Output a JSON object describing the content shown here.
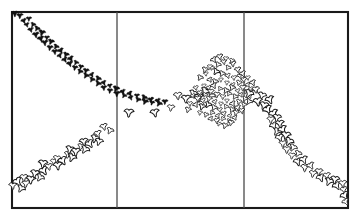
{
  "figure": {
    "title": "",
    "background_color": "#ffffff",
    "ink_color": "#111111",
    "frame_color": "#1a1a1a",
    "divider_color": "#4a4a4a",
    "width": 359,
    "height": 221
  },
  "frame": {
    "name": "plot-frame",
    "x": 12,
    "y": 12,
    "width": 336,
    "height": 196,
    "stroke_width": 2.1
  },
  "panels": {
    "count": 3,
    "divider_x": [
      117,
      244
    ],
    "labels": [
      "",
      "",
      ""
    ]
  },
  "axes": {
    "xlabel": "",
    "ylabel": "",
    "xticks": [],
    "yticks": [],
    "grid": false
  },
  "legend": {
    "visible": false,
    "entries": []
  },
  "chart_data": {
    "type": "scatter",
    "title": "",
    "xlabel": "",
    "ylabel": "",
    "xlim": [
      12,
      348
    ],
    "ylim": [
      208,
      12
    ],
    "grid": false,
    "legend_position": "none",
    "marker_style": "bird-glyph",
    "panel_dividers_x": [
      117,
      244
    ],
    "series": [
      {
        "name": "descending-dark-trail",
        "marker": "bird-glyph-filled",
        "color": "#111111",
        "points": [
          [
            15,
            14
          ],
          [
            20,
            16
          ],
          [
            24,
            21
          ],
          [
            29,
            19
          ],
          [
            27,
            25
          ],
          [
            33,
            25
          ],
          [
            31,
            30
          ],
          [
            37,
            29
          ],
          [
            36,
            35
          ],
          [
            42,
            33
          ],
          [
            41,
            39
          ],
          [
            47,
            38
          ],
          [
            45,
            43
          ],
          [
            51,
            42
          ],
          [
            50,
            48
          ],
          [
            56,
            47
          ],
          [
            55,
            52
          ],
          [
            61,
            51
          ],
          [
            60,
            56
          ],
          [
            66,
            55
          ],
          [
            65,
            60
          ],
          [
            71,
            59
          ],
          [
            70,
            64
          ],
          [
            76,
            63
          ],
          [
            75,
            68
          ],
          [
            81,
            67
          ],
          [
            80,
            72
          ],
          [
            86,
            71
          ],
          [
            86,
            76
          ],
          [
            92,
            75
          ],
          [
            92,
            80
          ],
          [
            98,
            79
          ],
          [
            98,
            84
          ],
          [
            104,
            83
          ],
          [
            104,
            88
          ],
          [
            110,
            86
          ],
          [
            110,
            91
          ],
          [
            116,
            89
          ],
          [
            117,
            94
          ],
          [
            123,
            92
          ],
          [
            124,
            96
          ],
          [
            130,
            94
          ],
          [
            131,
            98
          ],
          [
            137,
            96
          ],
          [
            138,
            100
          ],
          [
            144,
            98
          ],
          [
            145,
            102
          ],
          [
            151,
            100
          ],
          [
            152,
            103
          ],
          [
            158,
            101
          ],
          [
            159,
            104
          ],
          [
            165,
            102
          ]
        ]
      },
      {
        "name": "valley-and-rise",
        "marker": "bird-glyph-open",
        "color": "#1b1b1b",
        "points": [
          [
            129,
            113
          ],
          [
            155,
            113
          ],
          [
            171,
            108
          ],
          [
            178,
            96
          ],
          [
            186,
            99
          ],
          [
            193,
            94
          ],
          [
            199,
            98
          ],
          [
            205,
            92
          ],
          [
            211,
            96
          ]
        ]
      },
      {
        "name": "ascending-open-trail",
        "marker": "bird-glyph-open",
        "color": "#1b1b1b",
        "points": [
          [
            13,
            186
          ],
          [
            18,
            182
          ],
          [
            21,
            189
          ],
          [
            26,
            184
          ],
          [
            24,
            178
          ],
          [
            31,
            180
          ],
          [
            35,
            174
          ],
          [
            40,
            178
          ],
          [
            44,
            171
          ],
          [
            43,
            164
          ],
          [
            49,
            167
          ],
          [
            54,
            162
          ],
          [
            58,
            166
          ],
          [
            57,
            159
          ],
          [
            63,
            161
          ],
          [
            68,
            155
          ],
          [
            72,
            158
          ],
          [
            70,
            150
          ],
          [
            76,
            152
          ],
          [
            81,
            147
          ],
          [
            85,
            150
          ],
          [
            84,
            142
          ],
          [
            90,
            144
          ],
          [
            95,
            139
          ],
          [
            99,
            142
          ],
          [
            98,
            134
          ],
          [
            104,
            127
          ],
          [
            110,
            131
          ]
        ]
      },
      {
        "name": "cluster-scatter",
        "marker": "bird-glyph-open",
        "color": "#151515",
        "points": [
          [
            206,
            74
          ],
          [
            212,
            68
          ],
          [
            218,
            65
          ],
          [
            224,
            62
          ],
          [
            228,
            68
          ],
          [
            233,
            64
          ],
          [
            238,
            70
          ],
          [
            216,
            72
          ],
          [
            222,
            74
          ],
          [
            228,
            76
          ],
          [
            234,
            78
          ],
          [
            240,
            76
          ],
          [
            210,
            80
          ],
          [
            215,
            82
          ],
          [
            221,
            80
          ],
          [
            227,
            83
          ],
          [
            233,
            85
          ],
          [
            239,
            83
          ],
          [
            244,
            80
          ],
          [
            204,
            86
          ],
          [
            209,
            88
          ],
          [
            214,
            86
          ],
          [
            220,
            89
          ],
          [
            226,
            91
          ],
          [
            232,
            88
          ],
          [
            238,
            91
          ],
          [
            243,
            88
          ],
          [
            248,
            85
          ],
          [
            200,
            93
          ],
          [
            205,
            95
          ],
          [
            211,
            92
          ],
          [
            217,
            95
          ],
          [
            223,
            97
          ],
          [
            229,
            94
          ],
          [
            235,
            97
          ],
          [
            241,
            95
          ],
          [
            246,
            92
          ],
          [
            251,
            89
          ],
          [
            198,
            99
          ],
          [
            203,
            101
          ],
          [
            209,
            99
          ],
          [
            215,
            102
          ],
          [
            221,
            104
          ],
          [
            227,
            101
          ],
          [
            233,
            104
          ],
          [
            239,
            102
          ],
          [
            245,
            99
          ],
          [
            250,
            96
          ],
          [
            196,
            105
          ],
          [
            202,
            107
          ],
          [
            208,
            105
          ],
          [
            214,
            108
          ],
          [
            220,
            110
          ],
          [
            226,
            107
          ],
          [
            232,
            110
          ],
          [
            238,
            108
          ],
          [
            244,
            105
          ],
          [
            249,
            102
          ],
          [
            200,
            113
          ],
          [
            206,
            115
          ],
          [
            212,
            113
          ],
          [
            218,
            116
          ],
          [
            224,
            114
          ],
          [
            230,
            116
          ],
          [
            236,
            113
          ],
          [
            242,
            111
          ],
          [
            211,
            119
          ],
          [
            217,
            121
          ],
          [
            223,
            119
          ],
          [
            229,
            121
          ],
          [
            235,
            118
          ],
          [
            219,
            124
          ],
          [
            225,
            126
          ],
          [
            231,
            123
          ],
          [
            210,
            67
          ],
          [
            214,
            60
          ],
          [
            220,
            57
          ],
          [
            226,
            59
          ],
          [
            232,
            61
          ],
          [
            243,
            74
          ],
          [
            248,
            78
          ],
          [
            253,
            83
          ],
          [
            256,
            90
          ],
          [
            205,
            70
          ],
          [
            200,
            78
          ],
          [
            196,
            88
          ],
          [
            193,
            96
          ],
          [
            190,
            104
          ],
          [
            188,
            110
          ]
        ]
      },
      {
        "name": "right-descending-trail",
        "marker": "bird-glyph-open",
        "color": "#1b1b1b",
        "points": [
          [
            249,
            94
          ],
          [
            256,
            90
          ],
          [
            262,
            96
          ],
          [
            258,
            102
          ],
          [
            264,
            106
          ],
          [
            270,
            100
          ],
          [
            268,
            110
          ],
          [
            274,
            114
          ],
          [
            271,
            120
          ],
          [
            277,
            118
          ],
          [
            274,
            126
          ],
          [
            280,
            124
          ],
          [
            277,
            132
          ],
          [
            283,
            130
          ],
          [
            280,
            138
          ],
          [
            286,
            136
          ],
          [
            283,
            144
          ],
          [
            289,
            142
          ],
          [
            287,
            150
          ],
          [
            293,
            148
          ],
          [
            292,
            156
          ],
          [
            298,
            154
          ],
          [
            298,
            162
          ],
          [
            304,
            160
          ],
          [
            305,
            168
          ],
          [
            311,
            166
          ],
          [
            313,
            174
          ],
          [
            319,
            172
          ],
          [
            321,
            178
          ],
          [
            327,
            176
          ],
          [
            329,
            182
          ],
          [
            335,
            180
          ],
          [
            337,
            186
          ],
          [
            343,
            184
          ],
          [
            344,
            190
          ],
          [
            345,
            196
          ],
          [
            346,
            202
          ]
        ]
      }
    ]
  }
}
